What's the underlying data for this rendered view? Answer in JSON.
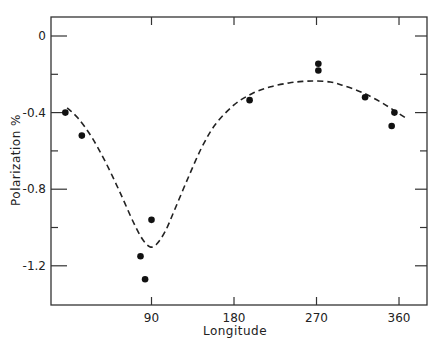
{
  "chart_data": {
    "type": "scatter",
    "title": "",
    "xlabel": "Longitude",
    "ylabel": "Polarization %",
    "xlim": [
      -20,
      390
    ],
    "ylim": [
      -1.41,
      0.1
    ],
    "xticks": [
      90,
      180,
      270,
      360
    ],
    "xtick_labels": [
      "90",
      "180",
      "270",
      "360"
    ],
    "xminor_ticks_top": [
      90,
      180,
      270,
      360
    ],
    "yticks": [
      0,
      -0.4,
      -0.8,
      -1.2
    ],
    "ytick_labels": [
      "0",
      "-0.4",
      "-0.8",
      "-1.2"
    ],
    "yminor_ticks": [
      -0.2,
      -0.6,
      -1.0
    ],
    "grid": false,
    "legend": null,
    "series": [
      {
        "name": "Observations",
        "style": "points",
        "x": [
          -4,
          14,
          78,
          83,
          90,
          197,
          272,
          272,
          323,
          352,
          355
        ],
        "y": [
          -0.4,
          -0.52,
          -1.15,
          -1.27,
          -0.96,
          -0.335,
          -0.145,
          -0.18,
          -0.32,
          -0.47,
          -0.4
        ]
      },
      {
        "name": "Fitted curve",
        "style": "dashed-line",
        "x": [
          -2,
          10,
          25,
          40,
          55,
          70,
          80,
          88,
          95,
          105,
          115,
          130,
          145,
          160,
          180,
          200,
          220,
          240,
          255,
          268,
          285,
          300,
          320,
          340,
          355,
          368
        ],
        "y": [
          -0.375,
          -0.43,
          -0.53,
          -0.66,
          -0.81,
          -0.97,
          -1.06,
          -1.1,
          -1.09,
          -1.02,
          -0.91,
          -0.74,
          -0.58,
          -0.46,
          -0.36,
          -0.3,
          -0.265,
          -0.245,
          -0.237,
          -0.235,
          -0.24,
          -0.26,
          -0.295,
          -0.345,
          -0.39,
          -0.43
        ]
      }
    ]
  }
}
